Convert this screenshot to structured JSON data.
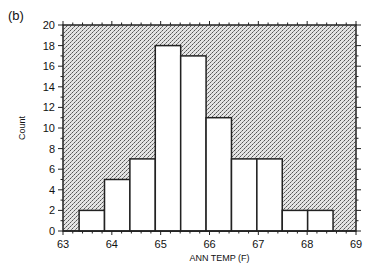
{
  "panel_label": "(b)",
  "chart_data": {
    "type": "bar",
    "subtype": "histogram",
    "title": "",
    "xlabel": "ANN TEMP  (F)",
    "ylabel": "Count",
    "xlim": [
      63,
      69
    ],
    "ylim": [
      0,
      20
    ],
    "x_ticks": [
      63,
      64,
      65,
      66,
      67,
      68,
      69
    ],
    "y_ticks": [
      0,
      2,
      4,
      6,
      8,
      10,
      12,
      14,
      16,
      18,
      20
    ],
    "bin_edges": [
      63.33,
      63.85,
      64.37,
      64.89,
      65.41,
      65.93,
      66.45,
      66.97,
      67.49,
      68.01,
      68.53
    ],
    "values": [
      2,
      5,
      7,
      18,
      17,
      11,
      7,
      7,
      2,
      2
    ],
    "grid": false,
    "legend": null,
    "background": "stippled gray",
    "bar_fill": "#ffffff",
    "bar_edge": "#222222"
  }
}
